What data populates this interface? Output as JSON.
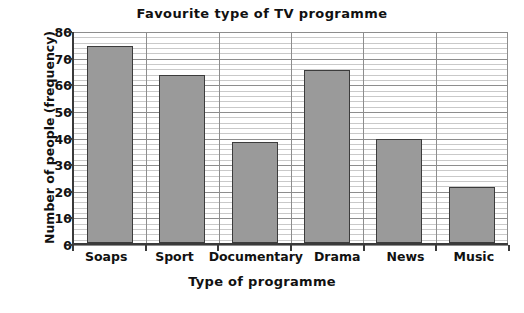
{
  "chart_data": {
    "type": "bar",
    "title": "Favourite type of TV programme",
    "xlabel": "Type of programme",
    "ylabel": "Number of people (frequency)",
    "categories": [
      "Soaps",
      "Sport",
      "Documentary",
      "Drama",
      "News",
      "Music"
    ],
    "values": [
      74,
      63,
      38,
      65,
      39,
      21
    ],
    "ylim": [
      0,
      80
    ],
    "ytick_step": 10,
    "yticks": [
      0,
      10,
      20,
      30,
      40,
      50,
      60,
      70,
      80
    ],
    "minor_gridline_step": 2,
    "grid": "horizontal-and-vertical",
    "legend": "none",
    "bar_color": "#9a9a9a",
    "bar_border_color": "#3c3c3c",
    "axis_color": "#3a3a3a",
    "major_gridline_color": "#8d8d8d",
    "minor_gridline_color": "#c9c9c9",
    "background": "#ffffff"
  }
}
